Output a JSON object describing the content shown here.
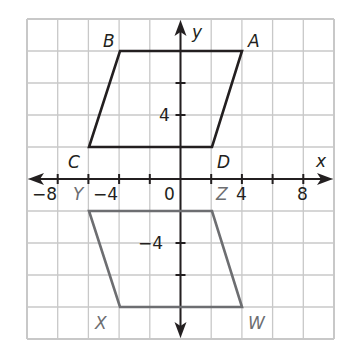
{
  "diagram": {
    "type": "coordinate-plane",
    "x_axis_label": "x",
    "y_axis_label": "y",
    "grid_step": 2,
    "x_range": [
      -10,
      10
    ],
    "y_range": [
      -10,
      10
    ],
    "x_tick_labels": [
      "−8",
      "−4",
      "0",
      "4",
      "8"
    ],
    "y_tick_labels": [
      "4",
      "−4"
    ],
    "colors": {
      "grid": "#c8c8c8",
      "axes": "#231f20",
      "figure_ABCD": "#231f20",
      "figure_WXYZ": "#6d6e71",
      "label_ABCD": "#231f20",
      "label_WXYZ": "#6d6e71"
    },
    "figures": [
      {
        "name": "ABCD",
        "vertices": [
          {
            "label": "A",
            "x": 4,
            "y": 8
          },
          {
            "label": "B",
            "x": -4,
            "y": 8
          },
          {
            "label": "C",
            "x": -6,
            "y": 2
          },
          {
            "label": "D",
            "x": 2,
            "y": 2
          }
        ]
      },
      {
        "name": "WXYZ",
        "vertices": [
          {
            "label": "W",
            "x": 4,
            "y": -8
          },
          {
            "label": "X",
            "x": -4,
            "y": -8
          },
          {
            "label": "Y",
            "x": -6,
            "y": -2
          },
          {
            "label": "Z",
            "x": 2,
            "y": -2
          }
        ]
      }
    ]
  }
}
